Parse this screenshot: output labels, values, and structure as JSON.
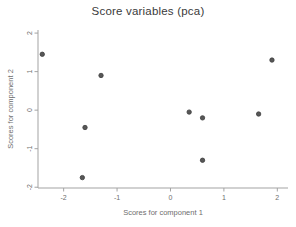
{
  "window": {
    "background": "#ffffff"
  },
  "colors": {
    "marker_fill": "#575757",
    "marker_stroke": "#3e3e3e",
    "axis_line": "#a3a3a3",
    "tick_mark": "#a3a3a3",
    "tick_label": "#6e6e6e",
    "title_color": "#3a3a3a",
    "axis_label_color": "#6e6e6e"
  },
  "chart_data": {
    "type": "scatter",
    "title": "Score variables (pca)",
    "xlabel": "Scores for component 1",
    "ylabel": "Scores for component 2",
    "xlim": [
      -2.48,
      2.2
    ],
    "ylim": [
      -2.02,
      2.08
    ],
    "xticks": [
      -2,
      -1,
      0,
      1,
      2
    ],
    "yticks": [
      -2,
      -1,
      0,
      1,
      2
    ],
    "grid": false,
    "legend": "none",
    "marker": "filled-circle",
    "points": [
      {
        "x": -2.4,
        "y": 1.45
      },
      {
        "x": -1.3,
        "y": 0.9
      },
      {
        "x": 1.9,
        "y": 1.3
      },
      {
        "x": 0.35,
        "y": -0.05
      },
      {
        "x": 0.6,
        "y": -0.2
      },
      {
        "x": 1.65,
        "y": -0.1
      },
      {
        "x": -1.6,
        "y": -0.45
      },
      {
        "x": 0.6,
        "y": -1.3
      },
      {
        "x": -1.65,
        "y": -1.75
      }
    ]
  }
}
